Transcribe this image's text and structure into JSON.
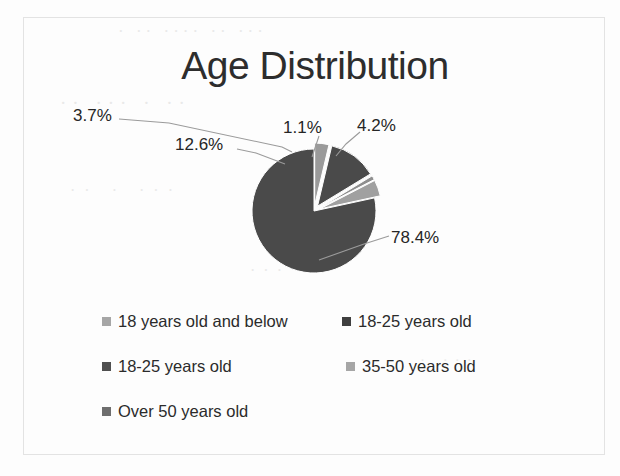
{
  "chart_data": {
    "type": "pie",
    "title": "Age Distribution",
    "categories": [
      "18 years old and below",
      "18-25 years old",
      "18-25 years old",
      "35-50 years old",
      "Over 50 years old"
    ],
    "values": [
      3.7,
      12.6,
      1.1,
      4.2,
      78.4
    ],
    "data_labels": [
      "3.7%",
      "12.6%",
      "1.1%",
      "4.2%",
      "78.4%"
    ],
    "unit": "%",
    "colors": [
      "#a6a6a6",
      "#4a4a4a",
      "#8f8f8f",
      "#a6a6a6",
      "#4a4a4a"
    ],
    "legend_position": "bottom",
    "grid": false,
    "xlabel": "",
    "ylabel": "",
    "slices": [
      {
        "label": "3.7%",
        "value": 3.7,
        "category": "18 years old and below",
        "color": "#9a9a9a",
        "exploded": true
      },
      {
        "label": "12.6%",
        "value": 12.6,
        "category": "18-25 years old",
        "color": "#4a4a4a",
        "exploded": true
      },
      {
        "label": "1.1%",
        "value": 1.1,
        "category": "18-25 years old",
        "color": "#8f8f8f",
        "exploded": true
      },
      {
        "label": "4.2%",
        "value": 4.2,
        "category": "35-50 years old",
        "color": "#a0a0a0",
        "exploded": true
      },
      {
        "label": "78.4%",
        "value": 78.4,
        "category": "Over 50 years old",
        "color": "#4a4a4a",
        "exploded": false
      }
    ]
  },
  "chart": {
    "title": "Age Distribution",
    "labels": {
      "a": "3.7%",
      "b": "12.6%",
      "c": "1.1%",
      "d": "4.2%",
      "e": "78.4%"
    }
  },
  "legend": {
    "rows": [
      {
        "left": {
          "label": "18 years old and below",
          "color": "#a6a6a6"
        },
        "right": {
          "label": "18-25 years old",
          "color": "#3f3f3f"
        }
      },
      {
        "left": {
          "label": "18-25 years old",
          "color": "#4f4f4f"
        },
        "right": {
          "label": "35-50 years old",
          "color": "#a6a6a6"
        }
      },
      {
        "left": {
          "label": "Over 50 years old",
          "color": "#6e6e6e"
        }
      }
    ]
  },
  "background_artifacts": {
    "line1": "· ·· ···· ·· ···",
    "line2": "·· ··· · ··",
    "line3": "·· · ···",
    "line4": "··· ··",
    "line5": "· ···"
  }
}
